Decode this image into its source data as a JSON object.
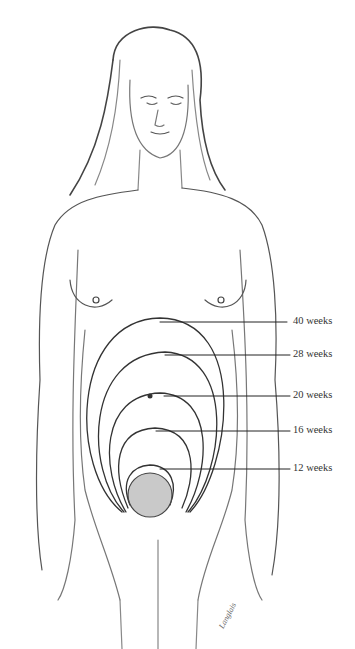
{
  "figure": {
    "labels": [
      {
        "text": "40 weeks",
        "y": 322,
        "line_x1": 160,
        "line_x2": 287
      },
      {
        "text": "28 weeks",
        "y": 355,
        "line_x1": 165,
        "line_x2": 290
      },
      {
        "text": "20 weeks",
        "y": 396,
        "line_x1": 164,
        "line_x2": 290
      },
      {
        "text": "16 weeks",
        "y": 431,
        "line_x1": 156,
        "line_x2": 290
      },
      {
        "text": "12 weeks",
        "y": 469,
        "line_x1": 160,
        "line_x2": 290
      }
    ],
    "signature": "Langlais"
  }
}
